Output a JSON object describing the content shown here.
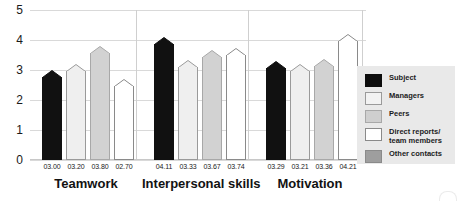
{
  "chart_data": {
    "type": "bar",
    "title": "",
    "subtitle": "",
    "xlabel": "",
    "ylabel": "",
    "ylim": [
      0,
      5
    ],
    "yticks": [
      "0",
      "1",
      "2",
      "3",
      "4",
      "5"
    ],
    "grid": true,
    "legend_position": "right",
    "categories": [
      "Teamwork",
      "Interpersonal skills",
      "Motivation"
    ],
    "series": [
      {
        "name": "Subject",
        "color": "#111111",
        "values": [
          3.0,
          4.11,
          3.29
        ],
        "labels": [
          "03.00",
          "04.11",
          "03.29"
        ]
      },
      {
        "name": "Managers",
        "color": "#efefef",
        "values": [
          3.2,
          3.33,
          3.21
        ],
        "labels": [
          "03.20",
          "03.33",
          "03.21"
        ]
      },
      {
        "name": "Peers",
        "color": "#d2d2d2",
        "values": [
          3.8,
          3.67,
          3.36
        ],
        "labels": [
          "03.80",
          "03.67",
          "03.36"
        ]
      },
      {
        "name": "Direct reports/\nteam members",
        "color": "#ffffff",
        "values": [
          2.7,
          3.74,
          4.21
        ],
        "labels": [
          "02.70",
          "03.74",
          "04.21"
        ]
      }
    ]
  },
  "legend": {
    "items": [
      {
        "label": "Subject",
        "swatch": "swatch-subject",
        "color": "#0d0d0d"
      },
      {
        "label": "Managers",
        "swatch": "swatch-managers",
        "color": "#f2f2f2"
      },
      {
        "label": "Peers",
        "swatch": "swatch-peers",
        "color": "#cfcfcf"
      },
      {
        "label": "Direct reports/\nteam members",
        "swatch": "swatch-direct-reports",
        "color": "#ffffff"
      },
      {
        "label": "Other contacts",
        "swatch": "swatch-other-contacts",
        "color": "#9e9e9e"
      }
    ]
  },
  "axis": {
    "y_labels": [
      "5",
      "4",
      "3",
      "2",
      "1",
      "0"
    ]
  }
}
